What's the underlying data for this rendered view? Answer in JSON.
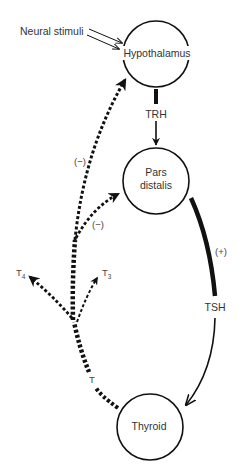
{
  "diagram": {
    "nodes": {
      "hypothalamus": {
        "label": "Hypothalamus"
      },
      "pars_distalis": {
        "line1": "Pars",
        "line2": "distalis"
      },
      "thyroid": {
        "label": "Thyroid"
      }
    },
    "inputs": {
      "neural_stimuli": "Neural stimuli"
    },
    "hormones": {
      "trh": "TRH",
      "tsh": "TSH",
      "t": "T",
      "t4": {
        "base": "T",
        "sub": "4"
      },
      "t3": {
        "base": "T",
        "sub": "3"
      }
    },
    "effects": {
      "tsh_effect": "(+)",
      "feedback_hypothalamus": "(−)",
      "feedback_pars_distalis": "(−)"
    },
    "colors": {
      "stroke": "#111111",
      "text": "#333333",
      "background": "#ffffff"
    }
  }
}
